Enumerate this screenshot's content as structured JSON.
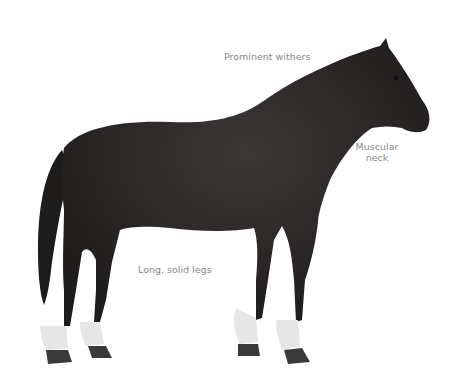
{
  "figure": {
    "labels": {
      "withers": "Prominent withers",
      "neck_line1": "Muscular",
      "neck_line2": "neck",
      "legs": "Long, solid legs"
    },
    "colors": {
      "coat": "#2e2b2b",
      "sock": "#e8e8e8",
      "hoof": "#3a3a3a",
      "label_text": "#8a8a8a"
    }
  }
}
